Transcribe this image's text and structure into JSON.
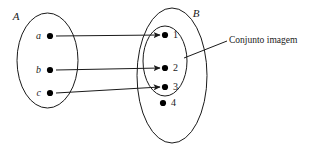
{
  "diagram": {
    "title_alt": "Mapping diagram from set A to set B showing the image set",
    "domain_set": {
      "label": "A",
      "elements": [
        {
          "label": "a",
          "dot_cx": 50,
          "dot_cy": 36
        },
        {
          "label": "b",
          "dot_cx": 50,
          "dot_cy": 70
        },
        {
          "label": "c",
          "dot_cy": 93,
          "dot_cx": 50
        }
      ]
    },
    "codomain_set": {
      "label": "B",
      "elements": [
        {
          "label": "1",
          "dot_cx": 165,
          "dot_cy": 35
        },
        {
          "label": "2",
          "dot_cx": 165,
          "dot_cy": 68
        },
        {
          "label": "3",
          "dot_cx": 165,
          "dot_cy": 87
        },
        {
          "label": "4",
          "dot_cx": 163,
          "dot_cy": 103
        }
      ]
    },
    "image_set": {
      "callout_label": "Conjunto imagem",
      "members": [
        "1",
        "2",
        "3"
      ]
    },
    "mappings": [
      {
        "from": "a",
        "to": "1"
      },
      {
        "from": "b",
        "to": "2"
      },
      {
        "from": "c",
        "to": "3"
      }
    ],
    "colors": {
      "ink": "#1a1a1a",
      "dot": "#000000",
      "background": "#ffffff"
    }
  }
}
